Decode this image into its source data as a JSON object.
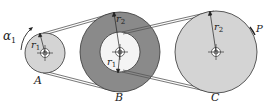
{
  "diagram": {
    "type": "belt-pulley-system",
    "colors": {
      "pulley_fill": "#d4d4d4",
      "pulley_b_ring": "#8a8a8a",
      "pulley_b_inner": "#f4f4f4",
      "stroke": "#333333",
      "belt": "#555555"
    },
    "pulleys": [
      {
        "id": "A",
        "label": "A",
        "cx": 45,
        "cy": 53,
        "r": 20,
        "radius_label": "r",
        "radius_sub": "1"
      },
      {
        "id": "B",
        "label": "B",
        "cx": 120,
        "cy": 52,
        "r_outer": 40,
        "r_inner": 20,
        "outer_radius_label": "r",
        "outer_radius_sub": "2",
        "inner_radius_label": "r",
        "inner_radius_sub": "1"
      },
      {
        "id": "C",
        "label": "C",
        "cx": 216,
        "cy": 52,
        "r": 41,
        "radius_label": "r",
        "radius_sub": "2"
      }
    ],
    "angle_label": {
      "symbol": "α",
      "sub": "1"
    },
    "point_label": "P"
  }
}
